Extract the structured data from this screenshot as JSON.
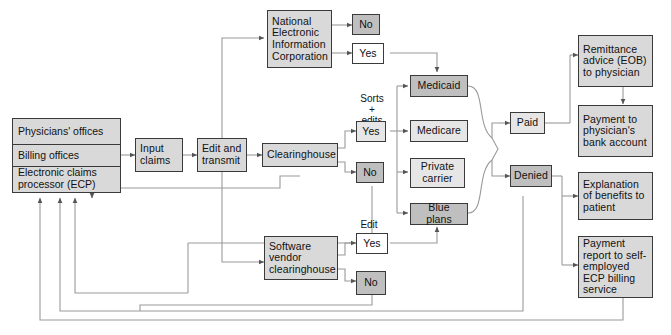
{
  "diagram": {
    "colors": {
      "box_fill_mid": "#d9d9d9",
      "box_fill_light": "#e6e6e6",
      "box_fill_dark": "#bfbfbf",
      "box_fill_white": "#ffffff",
      "border": "#3a3a3a",
      "wire": "#8c8c8c",
      "background": "#ffffff"
    }
  },
  "nodes": {
    "source_stack": {
      "name": "claim-originators",
      "segments": [
        "Physicians' offices",
        "Billing offices",
        "Electronic claims processor (ECP)"
      ]
    },
    "input_claims": "Input claims",
    "edit_and_transmit": "Edit and transmit",
    "neic": "National Electronic Information Corporation",
    "neic_no": "No",
    "neic_yes": "Yes",
    "clearinghouse": "Clearinghouse",
    "clearinghouse_yes": "Yes",
    "clearinghouse_no": "No",
    "software_vendor": "Software vendor clearinghouse",
    "software_yes": "Yes",
    "software_no": "No",
    "payers": {
      "medicaid": "Medicaid",
      "medicare": "Medicare",
      "private_carrier": "Private carrier",
      "blue_plans": "Blue plans"
    },
    "paid": "Paid",
    "denied": "Denied",
    "outcomes": {
      "remittance": "Remittance advice (EOB) to physician",
      "payment_bank": "Payment to physician's bank account",
      "eob_patient": "Explanation of benefits to patient",
      "payment_report": "Payment report to self-employed ECP billing service"
    }
  },
  "labels": {
    "sorts_edits": "Sorts\n+\nedits",
    "sorts_edits_line1": "Sorts",
    "sorts_edits_line2": "+",
    "sorts_edits_line3": "edits",
    "edit": "Edit"
  }
}
